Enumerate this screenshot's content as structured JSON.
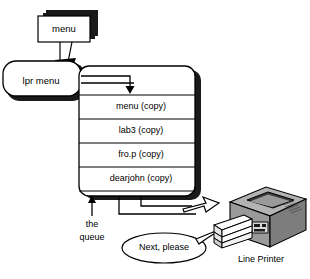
{
  "diagram": {
    "source_document": {
      "label": "menu",
      "name": "menu-document"
    },
    "command": {
      "label": "lpr menu",
      "name": "lpr-menu-command"
    },
    "queue": {
      "caption_line1": "the",
      "caption_line2": "queue",
      "jobs": [
        {
          "label": "menu (copy)"
        },
        {
          "label": "lab3 (copy)"
        },
        {
          "label": "fro.p (copy)"
        },
        {
          "label": "dearjohn (copy)"
        }
      ]
    },
    "printer": {
      "label": "Line Printer",
      "speech": "Next, please"
    },
    "colors": {
      "outline": "#000000",
      "paper": "#ffffff",
      "shadow": "#1a1a1a",
      "printer_top": "#b3b3b3",
      "printer_front": "#9a9a9a",
      "printer_side": "#7d7d7d",
      "printer_dark": "#3a3a3a",
      "tray_paper": "#ffffff"
    }
  }
}
